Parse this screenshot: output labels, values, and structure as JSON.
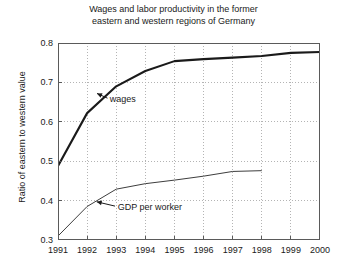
{
  "chart_data": {
    "type": "line",
    "title": "Wages and labor productivity in the former\neastern and western regions of Germany",
    "xlabel": "",
    "ylabel": "Ratio of eastern to western value",
    "xlim": [
      1991,
      2000
    ],
    "ylim": [
      0.3,
      0.8
    ],
    "grid": true,
    "legend_position": "inline-annotations",
    "x": [
      1991,
      1992,
      1993,
      1994,
      1995,
      1996,
      1997,
      1998,
      1999,
      2000
    ],
    "xticks": [
      "1991",
      "1992",
      "1993",
      "1994",
      "1995",
      "1996",
      "1997",
      "1998",
      "1999",
      "2000"
    ],
    "yticks": [
      "0.3",
      "0.4",
      "0.5",
      "0.6",
      "0.7",
      "0.8"
    ],
    "ytick_values": [
      0.3,
      0.4,
      0.5,
      0.6,
      0.7,
      0.8
    ],
    "series": [
      {
        "name": "wages",
        "color": "#1a1a1a",
        "line_width": 2.1,
        "x": [
          1991,
          1992,
          1993,
          1994,
          1995,
          1996,
          1997,
          1998,
          1999,
          2000
        ],
        "values": [
          0.488,
          0.622,
          0.69,
          0.729,
          0.754,
          0.759,
          0.763,
          0.767,
          0.775,
          0.777
        ]
      },
      {
        "name": "GDP per worker",
        "color": "#3d3d3d",
        "line_width": 1.0,
        "x": [
          1991,
          1992,
          1993,
          1994,
          1995,
          1996,
          1997,
          1998
        ],
        "values": [
          0.31,
          0.385,
          0.429,
          0.443,
          0.452,
          0.462,
          0.474,
          0.476
        ]
      }
    ],
    "annotations": [
      {
        "text": "wages",
        "label_x": 1992.78,
        "label_y": 0.657,
        "arrow_from_x": 1992.7,
        "arrow_from_y": 0.66,
        "arrow_to_x": 1992.34,
        "arrow_to_y": 0.672
      },
      {
        "text": "GDP per worker",
        "label_x": 1993.05,
        "label_y": 0.384,
        "arrow_from_x": 1992.96,
        "arrow_from_y": 0.386,
        "arrow_to_x": 1992.33,
        "arrow_to_y": 0.397
      }
    ]
  }
}
